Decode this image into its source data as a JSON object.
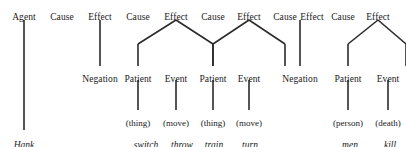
{
  "diagram": {
    "width": 406,
    "height": 147,
    "edge_color": "#2b2b2b",
    "text_color": "#1a1a1a",
    "background": "#ffffff",
    "rows": {
      "row1_y": 12,
      "row2_y": 74,
      "row3_y": 118,
      "row4_y": 140
    },
    "row1": [
      {
        "label": "Agent",
        "x": 24
      },
      {
        "label": "Cause",
        "x": 62
      },
      {
        "label": "Effect",
        "x": 100
      },
      {
        "label": "Cause",
        "x": 138
      },
      {
        "label": "Effect",
        "x": 176
      },
      {
        "label": "Cause",
        "x": 213
      },
      {
        "label": "Effect",
        "x": 249
      },
      {
        "label": "Cause",
        "x": 285
      },
      {
        "label": "Effect",
        "x": 312
      },
      {
        "label": "Cause",
        "x": 343
      },
      {
        "label": "Effect",
        "x": 378
      }
    ],
    "row2": [
      {
        "label": "Negation",
        "x": 100
      },
      {
        "label": "Patient",
        "x": 138
      },
      {
        "label": "Event",
        "x": 176
      },
      {
        "label": "Patient",
        "x": 213
      },
      {
        "label": "Event",
        "x": 249
      },
      {
        "label": "Negation",
        "x": 300
      },
      {
        "label": "Patient",
        "x": 348
      },
      {
        "label": "Event",
        "x": 388
      }
    ],
    "row3": [
      {
        "label": "(thing)",
        "x": 138
      },
      {
        "label": "(move)",
        "x": 176
      },
      {
        "label": "(thing)",
        "x": 213
      },
      {
        "label": "(move)",
        "x": 249
      },
      {
        "label": "(person)",
        "x": 348
      },
      {
        "label": "(death)",
        "x": 388
      }
    ],
    "row4": [
      {
        "label": "Hank",
        "x": 24
      },
      {
        "label": "switch",
        "x": 146
      },
      {
        "label": "throw",
        "x": 182
      },
      {
        "label": "train",
        "x": 214
      },
      {
        "label": "turn",
        "x": 250
      },
      {
        "label": "men",
        "x": 350
      },
      {
        "label": "kill",
        "x": 390
      }
    ],
    "edges": [
      {
        "name": "agent-to-hank",
        "x1": 24,
        "y1": 20,
        "x2": 24,
        "y2": 130
      },
      {
        "name": "effect1-to-negation",
        "x1": 100,
        "y1": 20,
        "x2": 100,
        "y2": 66
      },
      {
        "name": "effect2-to-patient-left",
        "x1": 176,
        "y1": 20,
        "x2": 138,
        "y2": 44
      },
      {
        "name": "effect2-to-event-right",
        "x1": 176,
        "y1": 20,
        "x2": 213,
        "y2": 44
      },
      {
        "name": "patient1-stem",
        "x1": 138,
        "y1": 44,
        "x2": 138,
        "y2": 66
      },
      {
        "name": "event1-stem",
        "x1": 213,
        "y1": 44,
        "x2": 213,
        "y2": 66
      },
      {
        "name": "patient1-to-thing",
        "x1": 138,
        "y1": 80,
        "x2": 138,
        "y2": 110
      },
      {
        "name": "event1-to-move",
        "x1": 176,
        "y1": 80,
        "x2": 176,
        "y2": 110
      },
      {
        "name": "effect3-to-patient-left",
        "x1": 249,
        "y1": 20,
        "x2": 213,
        "y2": 44
      },
      {
        "name": "effect3-to-event-right",
        "x1": 249,
        "y1": 20,
        "x2": 285,
        "y2": 44
      },
      {
        "name": "patient2-stem",
        "x1": 213,
        "y1": 44,
        "x2": 213,
        "y2": 66
      },
      {
        "name": "event2-stem",
        "x1": 285,
        "y1": 44,
        "x2": 285,
        "y2": 66
      },
      {
        "name": "patient2-to-thing",
        "x1": 213,
        "y1": 80,
        "x2": 213,
        "y2": 110
      },
      {
        "name": "event2-to-move",
        "x1": 249,
        "y1": 80,
        "x2": 249,
        "y2": 110
      },
      {
        "name": "effect4-to-negation",
        "x1": 300,
        "y1": 20,
        "x2": 300,
        "y2": 66
      },
      {
        "name": "effect5-to-patient-left",
        "x1": 378,
        "y1": 20,
        "x2": 348,
        "y2": 44
      },
      {
        "name": "effect5-to-event-right",
        "x1": 378,
        "y1": 20,
        "x2": 406,
        "y2": 44
      },
      {
        "name": "patient3-stem",
        "x1": 348,
        "y1": 44,
        "x2": 348,
        "y2": 66
      },
      {
        "name": "event3-stem",
        "x1": 406,
        "y1": 44,
        "x2": 406,
        "y2": 66
      },
      {
        "name": "patient3-to-person",
        "x1": 348,
        "y1": 80,
        "x2": 348,
        "y2": 110
      },
      {
        "name": "event3-to-death",
        "x1": 388,
        "y1": 80,
        "x2": 388,
        "y2": 110
      }
    ]
  }
}
